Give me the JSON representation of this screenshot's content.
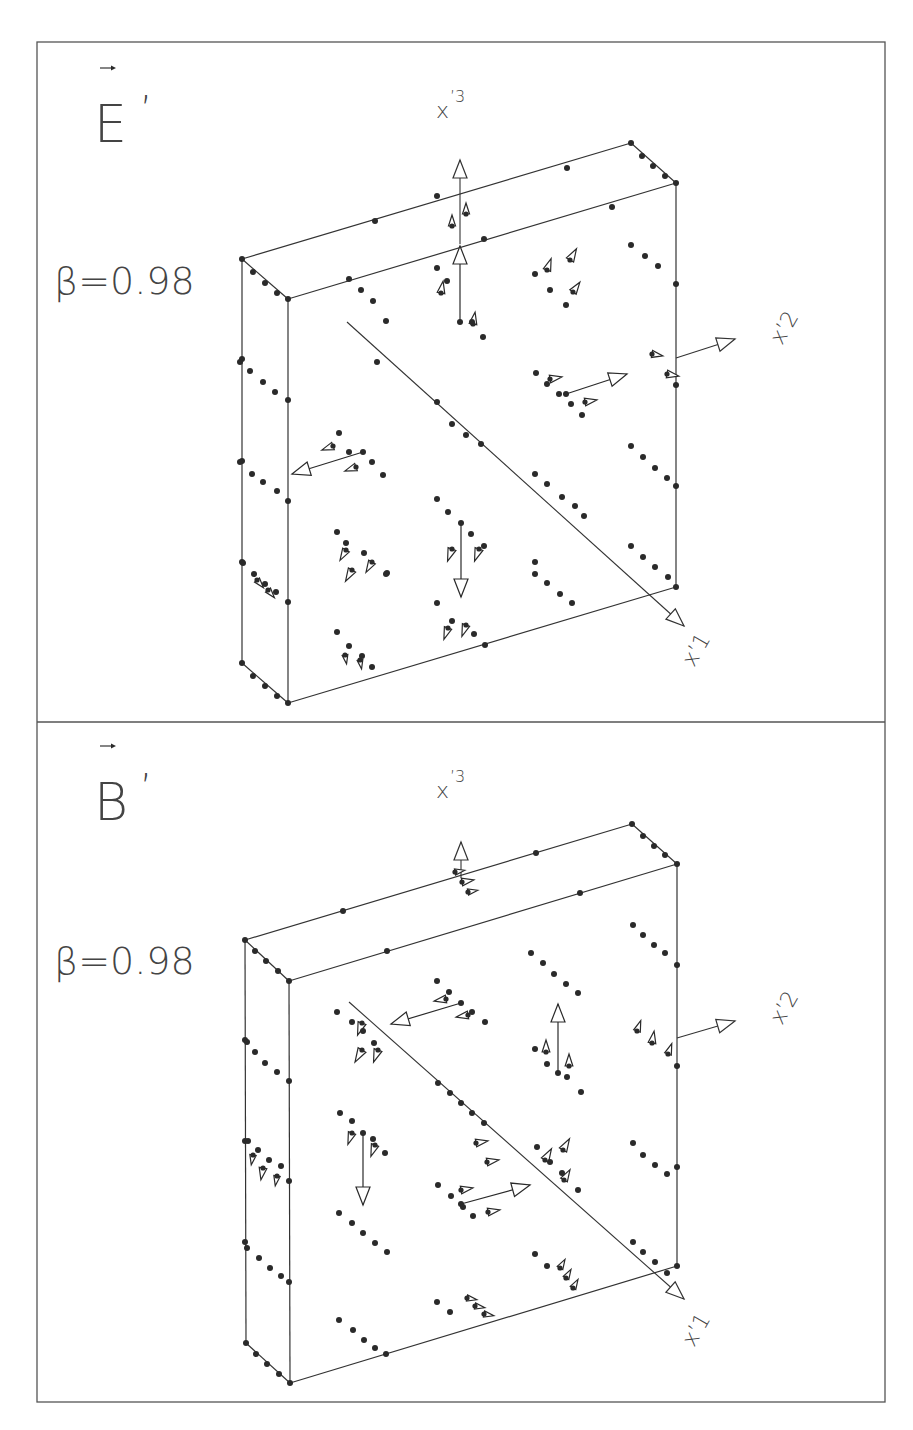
{
  "frame": {
    "x": 37,
    "y": 42,
    "width": 848,
    "height": 1360,
    "divider_y": 722
  },
  "panels": [
    {
      "id": "E",
      "title": "E",
      "title_prime": "’",
      "title_pos": [
        94,
        142
      ],
      "vector_arrow": [
        100,
        68,
        112,
        68
      ],
      "beta_label": "β=0.98",
      "beta_pos": [
        54,
        294
      ],
      "axis_labels": {
        "x3": {
          "text": "x",
          "sup": "’3",
          "pos": [
            436,
            118
          ]
        },
        "x2": {
          "text": "x’2",
          "pos": [
            782,
            346
          ],
          "rotate": -60
        },
        "x1": {
          "text": "x’1",
          "pos": [
            694,
            668
          ],
          "rotate": -60
        }
      },
      "box": {
        "btl": [
          242,
          259
        ],
        "ftl": [
          288,
          299
        ],
        "fbl": [
          288,
          703
        ],
        "bbl": [
          242,
          663
        ],
        "btr": [
          631,
          143
        ],
        "ftr": [
          676,
          183
        ],
        "fbr": [
          676,
          587
        ]
      },
      "axes": [
        {
          "name": "x3",
          "from": [
            460,
            244
          ],
          "to": [
            460,
            160
          ]
        },
        {
          "name": "x2",
          "from": [
            676,
            358
          ],
          "to": [
            735,
            339
          ]
        },
        {
          "name": "x1",
          "from": [
            347,
            322
          ],
          "to": [
            684,
            626
          ]
        }
      ],
      "vectors": [
        {
          "from": [
            460,
            322
          ],
          "to": [
            460,
            246
          ]
        },
        {
          "from": [
            363,
            452
          ],
          "to": [
            292,
            474
          ]
        },
        {
          "from": [
            566,
            394
          ],
          "to": [
            627,
            374
          ]
        },
        {
          "from": [
            461,
            523
          ],
          "to": [
            461,
            597
          ]
        }
      ],
      "small_heads": [
        [
          452,
          226,
          0,
          11
        ],
        [
          466,
          214,
          0,
          11
        ],
        [
          441,
          293,
          10,
          12
        ],
        [
          473,
          324,
          10,
          12
        ],
        [
          547,
          270,
          20,
          12
        ],
        [
          570,
          260,
          30,
          13
        ],
        [
          573,
          292,
          35,
          12
        ],
        [
          550,
          379,
          80,
          12
        ],
        [
          585,
          402,
          80,
          12
        ],
        [
          652,
          354,
          100,
          11
        ],
        [
          667,
          374,
          100,
          12
        ],
        [
          333,
          446,
          250,
          12
        ],
        [
          356,
          467,
          250,
          12
        ],
        [
          452,
          549,
          200,
          13
        ],
        [
          479,
          549,
          200,
          13
        ],
        [
          346,
          550,
          210,
          12
        ],
        [
          352,
          570,
          210,
          13
        ],
        [
          372,
          562,
          210,
          12
        ],
        [
          448,
          628,
          200,
          12
        ],
        [
          466,
          625,
          200,
          12
        ],
        [
          257,
          580,
          140,
          10
        ],
        [
          268,
          590,
          140,
          10
        ],
        [
          345,
          655,
          170,
          9
        ],
        [
          360,
          660,
          170,
          9
        ]
      ],
      "dots": [
        [
          242,
          259
        ],
        [
          288,
          299
        ],
        [
          288,
          703
        ],
        [
          242,
          663
        ],
        [
          631,
          143
        ],
        [
          676,
          183
        ],
        [
          676,
          587
        ],
        [
          253,
          272
        ],
        [
          265,
          283
        ],
        [
          277,
          293
        ],
        [
          642,
          156
        ],
        [
          653,
          166
        ],
        [
          665,
          176
        ],
        [
          253,
          676
        ],
        [
          265,
          686
        ],
        [
          277,
          696
        ],
        [
          437,
          196
        ],
        [
          484,
          239
        ],
        [
          567,
          168
        ],
        [
          612,
          207
        ],
        [
          375,
          221
        ],
        [
          387,
          573
        ],
        [
          242,
          359
        ],
        [
          242,
          461
        ],
        [
          242,
          562
        ],
        [
          288,
          400
        ],
        [
          288,
          501
        ],
        [
          288,
          602
        ],
        [
          676,
          284
        ],
        [
          676,
          385
        ],
        [
          676,
          486
        ],
        [
          349,
          279
        ],
        [
          361,
          290
        ],
        [
          373,
          301
        ],
        [
          386,
          321
        ],
        [
          377,
          362
        ],
        [
          437,
          402
        ],
        [
          452,
          424
        ],
        [
          466,
          435
        ],
        [
          481,
          444
        ],
        [
          535,
          474
        ],
        [
          547,
          484
        ],
        [
          562,
          497
        ],
        [
          575,
          506
        ],
        [
          584,
          516
        ],
        [
          631,
          245
        ],
        [
          645,
          256
        ],
        [
          658,
          266
        ],
        [
          631,
          446
        ],
        [
          643,
          457
        ],
        [
          655,
          468
        ],
        [
          667,
          478
        ],
        [
          631,
          546
        ],
        [
          643,
          557
        ],
        [
          655,
          567
        ],
        [
          668,
          577
        ],
        [
          535,
          574
        ],
        [
          547,
          583
        ],
        [
          560,
          594
        ],
        [
          572,
          603
        ],
        [
          536,
          373
        ],
        [
          547,
          384
        ],
        [
          559,
          394
        ],
        [
          571,
          404
        ],
        [
          582,
          415
        ],
        [
          535,
          274
        ],
        [
          550,
          290
        ],
        [
          566,
          305
        ],
        [
          437,
          499
        ],
        [
          448,
          512
        ],
        [
          471,
          534
        ],
        [
          484,
          546
        ],
        [
          437,
          603
        ],
        [
          452,
          621
        ],
        [
          474,
          634
        ],
        [
          485,
          645
        ],
        [
          337,
          532
        ],
        [
          346,
          543
        ],
        [
          364,
          553
        ],
        [
          386,
          574
        ],
        [
          337,
          632
        ],
        [
          349,
          646
        ],
        [
          362,
          656
        ],
        [
          372,
          667
        ],
        [
          240,
          362
        ],
        [
          250,
          371
        ],
        [
          263,
          382
        ],
        [
          275,
          392
        ],
        [
          240,
          462
        ],
        [
          252,
          474
        ],
        [
          263,
          482
        ],
        [
          277,
          491
        ],
        [
          243,
          563
        ],
        [
          254,
          574
        ],
        [
          265,
          584
        ],
        [
          276,
          592
        ],
        [
          339,
          433
        ],
        [
          349,
          452
        ],
        [
          372,
          462
        ],
        [
          383,
          475
        ],
        [
          437,
          268
        ],
        [
          447,
          281
        ],
        [
          472,
          322
        ],
        [
          483,
          337
        ],
        [
          535,
          562
        ]
      ]
    },
    {
      "id": "B",
      "title": "B",
      "title_prime": "’",
      "title_pos": [
        94,
        820
      ],
      "vector_arrow": [
        100,
        746,
        112,
        746
      ],
      "beta_label": "β=0.98",
      "beta_pos": [
        54,
        974
      ],
      "axis_labels": {
        "x3": {
          "text": "x",
          "sup": "’3",
          "pos": [
            436,
            798
          ]
        },
        "x2": {
          "text": "x’2",
          "pos": [
            782,
            1026
          ],
          "rotate": -60
        },
        "x1": {
          "text": "x’1",
          "pos": [
            694,
            1348
          ],
          "rotate": -60
        }
      },
      "box": {
        "btl": [
          245,
          940
        ],
        "ftl": [
          289,
          981
        ],
        "fbl": [
          290,
          1383
        ],
        "bbl": [
          246,
          1343
        ],
        "btr": [
          632,
          824
        ],
        "ftr": [
          677,
          864
        ],
        "fbr": [
          677,
          1266
        ]
      },
      "axes": [
        {
          "name": "x3",
          "from": [
            461,
            878
          ],
          "to": [
            461,
            842
          ]
        },
        {
          "name": "x2",
          "from": [
            677,
            1038
          ],
          "to": [
            735,
            1021
          ]
        },
        {
          "name": "x1",
          "from": [
            349,
            1002
          ],
          "to": [
            684,
            1299
          ]
        }
      ],
      "vectors": [
        {
          "from": [
            461,
            1003
          ],
          "to": [
            391,
            1024
          ]
        },
        {
          "from": [
            558,
            1073
          ],
          "to": [
            558,
            1004
          ]
        },
        {
          "from": [
            363,
            1133
          ],
          "to": [
            363,
            1205
          ]
        },
        {
          "from": [
            461,
            1204
          ],
          "to": [
            530,
            1185
          ]
        }
      ],
      "small_heads": [
        [
          455,
          872,
          80,
          10
        ],
        [
          462,
          882,
          80,
          12
        ],
        [
          468,
          892,
          80,
          10
        ],
        [
          362,
          1023,
          200,
          13
        ],
        [
          362,
          1050,
          210,
          14
        ],
        [
          378,
          1050,
          200,
          13
        ],
        [
          446,
          999,
          260,
          12
        ],
        [
          468,
          1015,
          260,
          12
        ],
        [
          546,
          1052,
          0,
          12
        ],
        [
          569,
          1066,
          0,
          12
        ],
        [
          637,
          1031,
          20,
          11
        ],
        [
          652,
          1043,
          10,
          12
        ],
        [
          668,
          1054,
          20,
          11
        ],
        [
          352,
          1133,
          200,
          12
        ],
        [
          375,
          1145,
          200,
          12
        ],
        [
          253,
          1155,
          190,
          10
        ],
        [
          263,
          1168,
          190,
          12
        ],
        [
          277,
          1176,
          190,
          10
        ],
        [
          545,
          1160,
          30,
          13
        ],
        [
          563,
          1150,
          30,
          13
        ],
        [
          564,
          1180,
          30,
          12
        ],
        [
          461,
          1190,
          80,
          12
        ],
        [
          488,
          1212,
          80,
          12
        ],
        [
          476,
          1143,
          80,
          12
        ],
        [
          487,
          1162,
          80,
          12
        ],
        [
          467,
          1298,
          100,
          10
        ],
        [
          475,
          1306,
          100,
          10
        ],
        [
          484,
          1314,
          100,
          10
        ],
        [
          560,
          1268,
          30,
          10
        ],
        [
          566,
          1278,
          30,
          10
        ],
        [
          573,
          1288,
          30,
          10
        ]
      ],
      "dots": [
        [
          245,
          940
        ],
        [
          289,
          981
        ],
        [
          290,
          1383
        ],
        [
          246,
          1343
        ],
        [
          632,
          824
        ],
        [
          677,
          864
        ],
        [
          677,
          1266
        ],
        [
          255,
          951
        ],
        [
          266,
          961
        ],
        [
          278,
          971
        ],
        [
          643,
          836
        ],
        [
          654,
          846
        ],
        [
          665,
          855
        ],
        [
          256,
          1354
        ],
        [
          267,
          1364
        ],
        [
          279,
          1374
        ],
        [
          343,
          911
        ],
        [
          387,
          951
        ],
        [
          536,
          853
        ],
        [
          580,
          893
        ],
        [
          245,
          1040
        ],
        [
          245,
          1141
        ],
        [
          245,
          1242
        ],
        [
          289,
          1081
        ],
        [
          289,
          1181
        ],
        [
          289,
          1282
        ],
        [
          677,
          965
        ],
        [
          677,
          1066
        ],
        [
          677,
          1167
        ],
        [
          633,
          925
        ],
        [
          643,
          935
        ],
        [
          654,
          945
        ],
        [
          665,
          953
        ],
        [
          531,
          953
        ],
        [
          543,
          963
        ],
        [
          554,
          974
        ],
        [
          566,
          984
        ],
        [
          578,
          993
        ],
        [
          438,
          1083
        ],
        [
          450,
          1093
        ],
        [
          461,
          1103
        ],
        [
          472,
          1113
        ],
        [
          484,
          1123
        ],
        [
          339,
          1213
        ],
        [
          352,
          1223
        ],
        [
          363,
          1233
        ],
        [
          375,
          1243
        ],
        [
          387,
          1252
        ],
        [
          339,
          1320
        ],
        [
          353,
          1330
        ],
        [
          364,
          1340
        ],
        [
          375,
          1348
        ],
        [
          386,
          1354
        ],
        [
          437,
          1302
        ],
        [
          450,
          1312
        ],
        [
          535,
          1254
        ],
        [
          547,
          1266
        ],
        [
          633,
          1242
        ],
        [
          643,
          1252
        ],
        [
          655,
          1262
        ],
        [
          667,
          1273
        ],
        [
          633,
          1143
        ],
        [
          643,
          1155
        ],
        [
          655,
          1165
        ],
        [
          667,
          1174
        ],
        [
          537,
          1147
        ],
        [
          550,
          1162
        ],
        [
          562,
          1173
        ],
        [
          578,
          1190
        ],
        [
          438,
          1185
        ],
        [
          451,
          1196
        ],
        [
          463,
          1207
        ],
        [
          473,
          1216
        ],
        [
          340,
          1113
        ],
        [
          352,
          1121
        ],
        [
          373,
          1139
        ],
        [
          385,
          1153
        ],
        [
          337,
          1012
        ],
        [
          352,
          1022
        ],
        [
          363,
          1031
        ],
        [
          374,
          1043
        ],
        [
          437,
          981
        ],
        [
          449,
          992
        ],
        [
          472,
          1012
        ],
        [
          485,
          1022
        ],
        [
          535,
          1049
        ],
        [
          547,
          1064
        ],
        [
          567,
          1077
        ],
        [
          581,
          1092
        ],
        [
          247,
          1042
        ],
        [
          255,
          1052
        ],
        [
          265,
          1063
        ],
        [
          277,
          1072
        ],
        [
          248,
          1141
        ],
        [
          258,
          1150
        ],
        [
          269,
          1160
        ],
        [
          281,
          1166
        ],
        [
          247,
          1248
        ],
        [
          259,
          1258
        ],
        [
          270,
          1268
        ],
        [
          281,
          1276
        ]
      ]
    }
  ]
}
